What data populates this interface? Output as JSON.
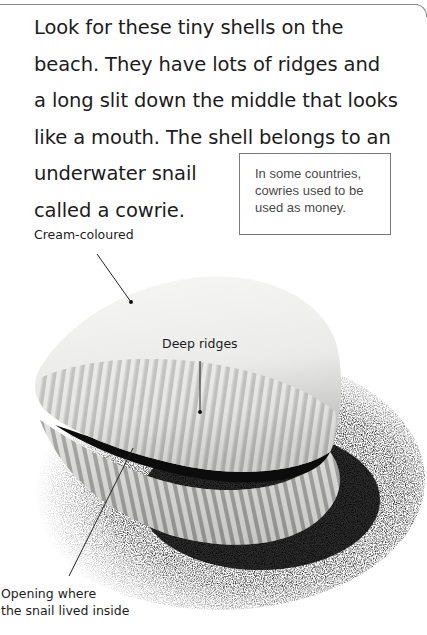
{
  "page": {
    "body_lines": [
      "Look for these tiny shells on the",
      "beach. They have lots of ridges and",
      "a long slit down the middle that looks",
      "like a mouth. The shell belongs to an",
      "underwater snail",
      "called a cowrie."
    ],
    "fact_box": {
      "lines": [
        "In some countries,",
        "cowries used to be",
        "used as money."
      ]
    },
    "labels": {
      "cream": "Cream-coloured",
      "ridges": "Deep ridges",
      "opening_line1": "Opening where",
      "opening_line2": "the snail lived inside"
    },
    "illustration": {
      "subject": "cowrie shell on sand",
      "colors": {
        "shell": "#e8e8e6",
        "ridge_shadow": "#9a9a98",
        "sand": "#2a2a2a",
        "slit": "#101010"
      }
    }
  }
}
